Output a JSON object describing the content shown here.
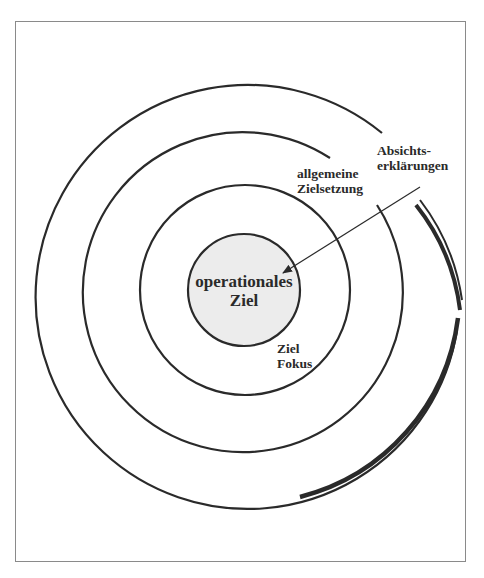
{
  "diagram": {
    "type": "concentric-goal-rings",
    "colors": {
      "line": "#2a2a2a",
      "core_fill": "#ececec",
      "frame": "#8a8a8a",
      "background": "#ffffff"
    },
    "rings": [
      {
        "id": "absichtserklaerungen",
        "label_lines": [
          "Absichts-",
          "erklärungen"
        ]
      },
      {
        "id": "allgemeine-zielsetzung",
        "label_lines": [
          "allgemeine",
          "Zielsetzung"
        ]
      },
      {
        "id": "ziel-fokus",
        "label_lines": [
          "Ziel",
          "Fokus"
        ]
      },
      {
        "id": "operationales-ziel",
        "label_lines": [
          "operationales",
          "Ziel"
        ]
      }
    ]
  }
}
